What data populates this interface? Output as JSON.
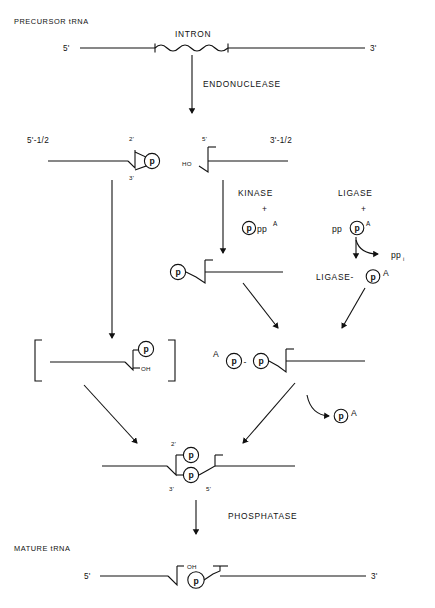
{
  "figure": {
    "type": "diagram",
    "background_color": "#ffffff",
    "line_color": "#111111"
  },
  "stages": {
    "precursor": {
      "label": "PRECURSOR tRNA",
      "five_prime": "5'",
      "three_prime": "3'",
      "intron_label": "INTRON"
    },
    "endonuclease": {
      "enzyme": "ENDONUCLEASE"
    },
    "halves": {
      "left_label": "5'-1/2",
      "right_label": "3'-1/2",
      "left_two_prime": "2'",
      "left_three_prime": "3'",
      "left_phosphate": "p",
      "right_five_prime": "5'",
      "right_hydroxyl": "HO"
    },
    "kinase": {
      "enzyme": "KINASE",
      "plus": "+",
      "cofactor_phosphate": "p",
      "cofactor_pp": "pp",
      "cofactor_adenosine": "A"
    },
    "ligase": {
      "enzyme": "LIGASE",
      "plus": "+",
      "cofactor_pp": "pp",
      "cofactor_phosphate": "p",
      "cofactor_adenosine": "A",
      "released_pp": "pp",
      "released_sub": "i",
      "adduct_label": "LIGASE-",
      "adduct_phosphate": "p",
      "adduct_adenosine": "A"
    },
    "phosphorylated_half": {
      "phosphate": "p"
    },
    "bracket_intermediate": {
      "bracket_open": "[",
      "bracket_close": "]",
      "phosphate": "p",
      "hydroxyl": "OH"
    },
    "adenylylated_half": {
      "adenosine": "A",
      "phosphate_1": "p",
      "dash": "-",
      "phosphate_2": "p"
    },
    "released_ap": {
      "phosphate": "p",
      "adenosine": "A"
    },
    "ligated_product": {
      "two_prime": "2'",
      "three_prime": "3'",
      "five_prime": "5'",
      "phosphate_top": "p",
      "phosphate_bottom": "p"
    },
    "phosphatase": {
      "enzyme": "PHOSPHATASE"
    },
    "mature": {
      "label": "MATURE tRNA",
      "five_prime": "5'",
      "three_prime": "3'",
      "hydroxyl": "OH",
      "phosphate": "p"
    }
  }
}
